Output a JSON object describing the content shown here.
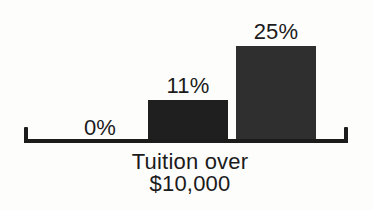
{
  "chart_data": {
    "type": "bar",
    "title": "",
    "categories": [
      "",
      "",
      ""
    ],
    "values": [
      0,
      11,
      25
    ],
    "bar_labels": [
      "0%",
      "11%",
      "25%"
    ],
    "xlabel": "Tuition over $10,000",
    "xlabel_lines": [
      "Tuition over",
      "$10,000"
    ],
    "ylabel": "",
    "ylim": [
      0,
      25
    ],
    "grid": false,
    "legend": false,
    "bar_colors": [
      "#1f1f1f",
      "#1f1f1f",
      "#2f2f2f"
    ],
    "axis_color": "#1c1c1c",
    "text_color": "#1b1b1b",
    "background_color": "#fdfdfc"
  }
}
